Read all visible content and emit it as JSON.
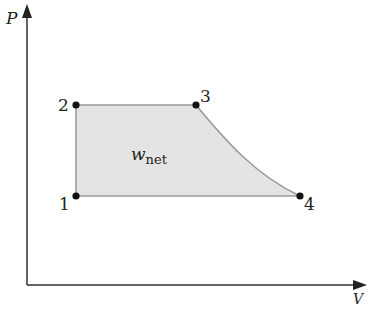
{
  "diagram": {
    "type": "P-v cycle diagram",
    "axes": {
      "y_label": "P",
      "x_label": "V"
    },
    "region_label": {
      "main": "w",
      "subscript": "net"
    },
    "points": [
      {
        "id": "1",
        "label": "1"
      },
      {
        "id": "2",
        "label": "2"
      },
      {
        "id": "3",
        "label": "3"
      },
      {
        "id": "4",
        "label": "4"
      }
    ],
    "processes": [
      {
        "from": "1",
        "to": "2",
        "kind": "constant volume"
      },
      {
        "from": "2",
        "to": "3",
        "kind": "constant pressure"
      },
      {
        "from": "3",
        "to": "4",
        "kind": "expansion curve"
      },
      {
        "from": "4",
        "to": "1",
        "kind": "constant pressure"
      }
    ],
    "colors": {
      "fill": "#e4e4e4",
      "outline": "#9a9a9a",
      "axis": "#333333",
      "point": "#111111"
    }
  }
}
